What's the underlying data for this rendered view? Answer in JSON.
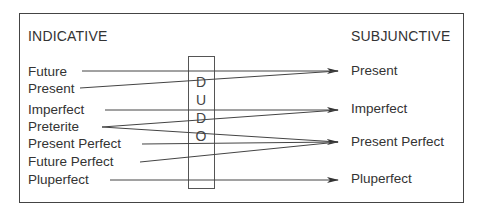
{
  "diagram": {
    "left_heading": "INDICATIVE",
    "right_heading": "SUBJUNCTIVE",
    "indicative": [
      {
        "label": "Future"
      },
      {
        "label": "Present"
      },
      {
        "label": "Imperfect"
      },
      {
        "label": "Preterite"
      },
      {
        "label": "Present Perfect"
      },
      {
        "label": "Future Perfect"
      },
      {
        "label": "Pluperfect"
      }
    ],
    "subjunctive": [
      {
        "label": "Present"
      },
      {
        "label": "Imperfect"
      },
      {
        "label": "Present Perfect"
      },
      {
        "label": "Pluperfect"
      }
    ],
    "middle_box_letters": [
      "D",
      "U",
      "D",
      "O"
    ],
    "mappings": [
      {
        "from": "Future",
        "to": "Present"
      },
      {
        "from": "Present",
        "to": "Present"
      },
      {
        "from": "Imperfect",
        "to": "Imperfect"
      },
      {
        "from": "Preterite",
        "to": "Imperfect"
      },
      {
        "from": "Preterite",
        "to": "Present Perfect"
      },
      {
        "from": "Present Perfect",
        "to": "Present Perfect"
      },
      {
        "from": "Future Perfect",
        "to": "Present Perfect"
      },
      {
        "from": "Pluperfect",
        "to": "Pluperfect"
      }
    ]
  }
}
